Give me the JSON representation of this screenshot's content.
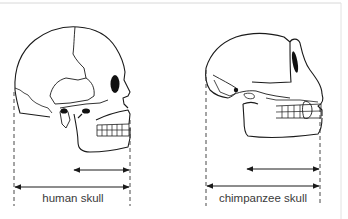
{
  "figure": {
    "frame_color": "#d8d8d8",
    "line_color": "#1a1a1a",
    "panels": [
      {
        "id": "human",
        "label": "human skull",
        "label_x": 73,
        "label_y": 192,
        "dashed_left_x": 14,
        "dashed_right_x": 130,
        "arrow_upper": {
          "x1": 73,
          "x2": 130,
          "y": 170
        },
        "arrow_lower": {
          "x1": 14,
          "x2": 130,
          "y": 187
        }
      },
      {
        "id": "chimpanzee",
        "label": "chimpanzee skull",
        "label_x": 263,
        "label_y": 192,
        "dashed_left_x": 206,
        "dashed_right_x": 320,
        "arrow_upper": {
          "x1": 246,
          "x2": 320,
          "y": 169
        },
        "arrow_lower": {
          "x1": 206,
          "x2": 320,
          "y": 186
        }
      }
    ]
  }
}
